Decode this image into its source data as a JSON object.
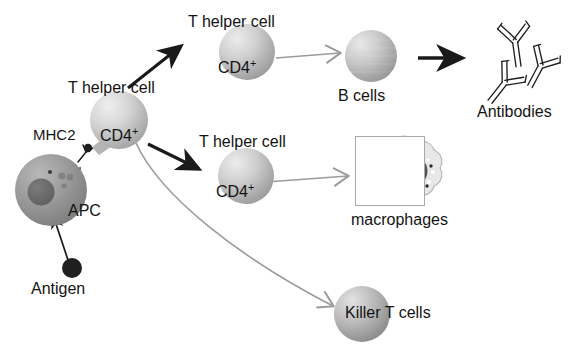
{
  "diagram": {
    "background_color": "#ffffff",
    "text_color": "#131313",
    "black_arrow_color": "#1a1a1a",
    "gray_arrow_color": "#9b9b9b",
    "macrophage_box_border_color": "#a9a9a9"
  },
  "labels": {
    "antigen": "Antigen",
    "apc": "APC",
    "mhc2": "MHC2",
    "t_helper_main": "T helper cell",
    "cd4_main": "CD4",
    "cd4_sup": "+",
    "t_helper_top": "T helper cell",
    "cd4_top": "CD4",
    "t_helper_mid": "T helper cell",
    "cd4_mid": "CD4",
    "b_cells": "B cells",
    "antibodies": "Antibodies",
    "macrophages": "macrophages",
    "killer_t_cells": "Killer T cells"
  },
  "cells": {
    "antigen": {
      "shape": "filled-circle",
      "color": "#201f1f",
      "diameter_px": 20
    },
    "apc": {
      "shape": "sphere",
      "color": "#9a9a9a",
      "nucleus_color": "#6b6b6b",
      "diameter_px": 72
    },
    "t_helper_main": {
      "shape": "sphere",
      "color": "#cfcfcf",
      "diameter_px": 58
    },
    "t_helper_top": {
      "shape": "sphere",
      "color": "#c9c9c9",
      "diameter_px": 56
    },
    "t_helper_mid": {
      "shape": "sphere",
      "color": "#c9c9c9",
      "diameter_px": 56
    },
    "b_cells": {
      "shape": "sphere",
      "color": "#c4c4c4",
      "diameter_px": 52
    },
    "killer_t_cells": {
      "shape": "sphere",
      "color": "#b8b8b8",
      "diameter_px": 56
    },
    "macrophage": {
      "shape": "amoeboid-cell",
      "nucleus_color": "#5a5a5a",
      "body_color": "#e6e6e6"
    }
  },
  "arrows": [
    {
      "id": "antigen-to-apc",
      "style": "thin-black",
      "from": "Antigen",
      "to": "APC"
    },
    {
      "id": "apc-internal-processing",
      "style": "thin-black",
      "from": "APC nucleus",
      "to": "APC surface"
    },
    {
      "id": "apc-to-mhc2",
      "style": "thin-black",
      "from": "APC surface",
      "to": "MHC2 complex"
    },
    {
      "id": "thelper-to-thelper-top",
      "style": "thick-black",
      "from": "T helper cell",
      "to": "T helper cell (top)"
    },
    {
      "id": "thelper-to-thelper-mid",
      "style": "thick-black",
      "from": "T helper cell",
      "to": "T helper cell (middle)"
    },
    {
      "id": "thelper-top-to-bcells",
      "style": "gray-open",
      "from": "T helper cell (top)",
      "to": "B cells"
    },
    {
      "id": "bcells-to-antibodies",
      "style": "thick-black",
      "from": "B cells",
      "to": "Antibodies"
    },
    {
      "id": "thelper-mid-to-macrophages",
      "style": "gray-open",
      "from": "T helper cell (middle)",
      "to": "macrophages"
    },
    {
      "id": "thelper-to-killer-t",
      "style": "gray-open-curved",
      "from": "T helper cell",
      "to": "Killer T cells"
    }
  ],
  "antibodies": {
    "count": 3,
    "shape": "Y-shaped double-line immunoglobulin"
  }
}
